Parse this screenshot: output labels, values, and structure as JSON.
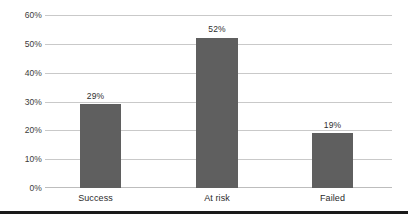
{
  "chart_data": {
    "type": "bar",
    "title": "",
    "subtitle": "",
    "xlabel": "",
    "ylabel": "",
    "categories": [
      "Success",
      "At risk",
      "Failed"
    ],
    "values": [
      29,
      52,
      19
    ],
    "value_labels": [
      "29%",
      "52%",
      "19%"
    ],
    "ylim": [
      0,
      60
    ],
    "ytick_values": [
      0,
      10,
      20,
      30,
      40,
      50,
      60
    ],
    "ytick_labels": [
      "0%",
      "10%",
      "20%",
      "30%",
      "40%",
      "50%",
      "60%"
    ],
    "grid": "horizontal",
    "legend": "none",
    "series": [
      {
        "name": "",
        "values": [
          29,
          52,
          19
        ]
      }
    ],
    "colors": {
      "bar_fill": "#5f5f5f",
      "gridline": "#c9c9c9",
      "baseline": "#bdbdbd",
      "tick_text": "#3b3b3b",
      "value_text": "#2e2e2e",
      "category_text": "#2b2b2b",
      "background": "#ffffff",
      "bottom_rule": "#1a1a1a"
    }
  }
}
